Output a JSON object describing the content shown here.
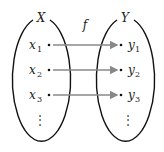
{
  "diagram": {
    "domain_label": "X",
    "codomain_label": "Y",
    "function_label": "f",
    "domain_elements": [
      {
        "name": "x",
        "sub": "1"
      },
      {
        "name": "x",
        "sub": "2"
      },
      {
        "name": "x",
        "sub": "3"
      }
    ],
    "codomain_elements": [
      {
        "name": "y",
        "sub": "1"
      },
      {
        "name": "y",
        "sub": "2"
      },
      {
        "name": "y",
        "sub": "3"
      }
    ],
    "ellipsis": "⋮",
    "colors": {
      "stroke": "#111111",
      "arrow": "#888888"
    }
  }
}
